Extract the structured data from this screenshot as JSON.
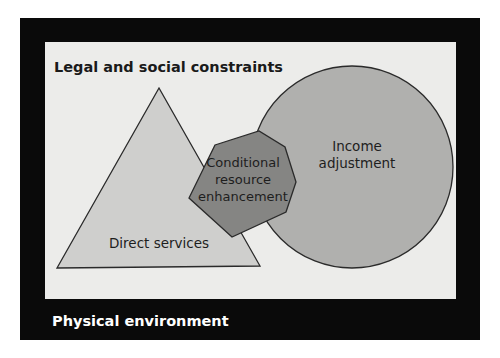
{
  "diagram": {
    "outer_frame": {
      "label": "Physical environment",
      "fill": "#0a0a0a",
      "text_color": "#ffffff"
    },
    "inner_panel": {
      "label": "Legal and social constraints",
      "fill": "#ececea",
      "text_color": "#1a1a1a"
    },
    "shapes": [
      {
        "id": "direct-services",
        "kind": "triangle",
        "label_lines": [
          "Direct services"
        ],
        "fill": "#cfcfcd",
        "stroke": "#2a2a2a"
      },
      {
        "id": "income-adjustment",
        "kind": "circle",
        "label_lines": [
          "Income",
          "adjustment"
        ],
        "fill": "#b0b0ae",
        "stroke": "#2a2a2a"
      },
      {
        "id": "conditional-resource-enhancement",
        "kind": "heptagon",
        "label_lines": [
          "Conditional",
          "resource",
          "enhancement"
        ],
        "fill": "#858583",
        "stroke": "#2a2a2a"
      }
    ]
  }
}
